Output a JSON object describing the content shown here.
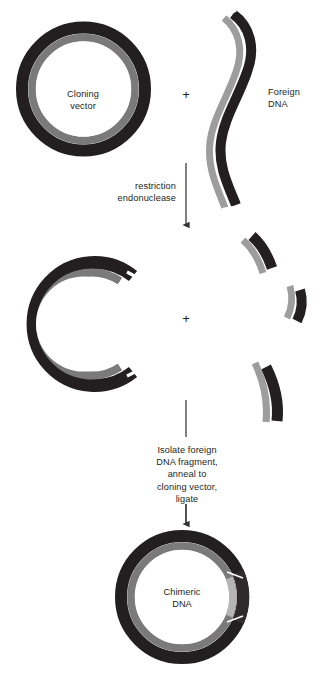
{
  "figure": {
    "background_color": "#ffffff",
    "colors": {
      "dark_strand": "#231f20",
      "gray_strand": "#7a7a7a",
      "light_insert": "#b5b5b5",
      "text": "#231f20",
      "arrow": "#4a4a4a"
    }
  },
  "labels": {
    "cloning_vector": "Cloning\nvector",
    "foreign_dna": "Foreign\nDNA",
    "restriction_step": "restriction\nendonuclease",
    "isolate_step": "Isolate foreign\nDNA fragment,\nanneal to\ncloning vector,\nligate",
    "chimeric_dna": "Chimeric\nDNA",
    "plus_top": "+",
    "plus_middle": "+",
    "bottom_caption": ""
  },
  "elements": {
    "cloning_vector_plasmid": {
      "name": "Cloning vector",
      "shape": "closed circular double-stranded DNA",
      "outer_strand_color": "#231f20",
      "inner_strand_color": "#7a7a7a"
    },
    "foreign_dna_molecule": {
      "name": "Foreign DNA",
      "shape": "linear S-curved double-stranded DNA",
      "left_strand_color": "#9d9d9d",
      "right_strand_color": "#231f20"
    },
    "cut_vector": {
      "name": "Linearized cloning vector",
      "shape": "open C-shaped double-stranded DNA with staggered sticky ends",
      "outer_strand_color": "#231f20",
      "inner_strand_color": "#7a7a7a"
    },
    "foreign_fragments": [
      {
        "id": "fragment-1",
        "position": "upper right",
        "note": "restriction fragment"
      },
      {
        "id": "fragment-2",
        "position": "middle right",
        "note": "restriction fragment"
      },
      {
        "id": "fragment-3",
        "position": "lower right",
        "note": "fragment of interest"
      }
    ],
    "chimeric_plasmid": {
      "name": "Chimeric DNA",
      "shape": "closed circular recombinant plasmid with inserted fragment",
      "outer_strand_color": "#231f20",
      "inner_strand_color": "#7a7a7a",
      "insert_color": "#b5b5b5"
    },
    "arrows": [
      {
        "id": "arrow-restriction",
        "direction": "down",
        "step_label": "restriction endonuclease"
      },
      {
        "id": "arrow-ligate",
        "direction": "down",
        "step_label": "Isolate foreign DNA fragment, anneal to cloning vector, ligate"
      }
    ]
  }
}
